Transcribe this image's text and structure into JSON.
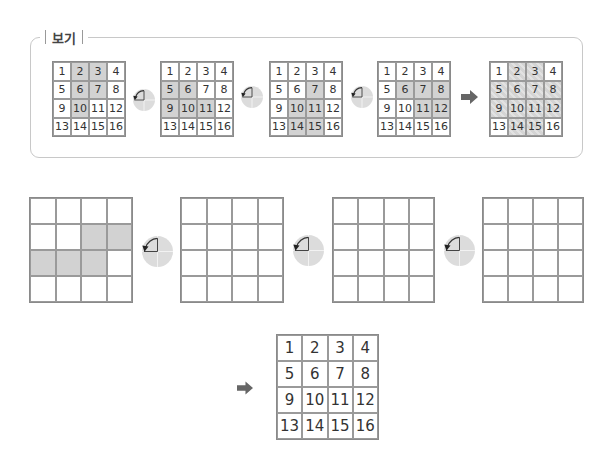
{
  "example": {
    "label": "보기",
    "grids": [
      {
        "cells": [
          "1",
          "2",
          "3",
          "4",
          "5",
          "6",
          "7",
          "8",
          "9",
          "10",
          "11",
          "12",
          "13",
          "14",
          "15",
          "16"
        ],
        "shaded": [
          2,
          3,
          6,
          7,
          10
        ]
      },
      {
        "cells": [
          "1",
          "2",
          "3",
          "4",
          "5",
          "6",
          "7",
          "8",
          "9",
          "10",
          "11",
          "12",
          "13",
          "14",
          "15",
          "16"
        ],
        "shaded": [
          5,
          6,
          9,
          10,
          11
        ]
      },
      {
        "cells": [
          "1",
          "2",
          "3",
          "4",
          "5",
          "6",
          "7",
          "8",
          "9",
          "10",
          "11",
          "12",
          "13",
          "14",
          "15",
          "16"
        ],
        "shaded": [
          7,
          10,
          11,
          14,
          15
        ]
      },
      {
        "cells": [
          "1",
          "2",
          "3",
          "4",
          "5",
          "6",
          "7",
          "8",
          "9",
          "10",
          "11",
          "12",
          "13",
          "14",
          "15",
          "16"
        ],
        "shaded": [
          6,
          7,
          8,
          11,
          12
        ]
      }
    ],
    "rotation_icons": [
      "quarter-turn-counterclockwise",
      "quarter-turn-counterclockwise",
      "quarter-turn-counterclockwise"
    ],
    "result_arrow": "right-arrow",
    "result_grid": {
      "cells": [
        "1",
        "2",
        "3",
        "4",
        "5",
        "6",
        "7",
        "8",
        "9",
        "10",
        "11",
        "12",
        "13",
        "14",
        "15",
        "16"
      ],
      "shaded": [
        2,
        3,
        5,
        6,
        7,
        8,
        9,
        10,
        11,
        12,
        14,
        15
      ]
    }
  },
  "problem": {
    "grids": [
      {
        "shaded": [
          7,
          8,
          9,
          10,
          11
        ]
      },
      {
        "shaded": []
      },
      {
        "shaded": []
      },
      {
        "shaded": []
      }
    ],
    "rotation_icons": [
      "quarter-turn-counterclockwise",
      "quarter-turn-counterclockwise",
      "quarter-turn-counterclockwise"
    ],
    "answer_arrow": "right-arrow",
    "answer_grid": {
      "cells": [
        "1",
        "2",
        "3",
        "4",
        "5",
        "6",
        "7",
        "8",
        "9",
        "10",
        "11",
        "12",
        "13",
        "14",
        "15",
        "16"
      ]
    }
  },
  "colors": {
    "shade": "#d2d2d2",
    "grid_line": "#9a9a9a",
    "icon_bg": "#dcdcdc",
    "arrow": "#666666",
    "border": "#c8c8c8"
  }
}
